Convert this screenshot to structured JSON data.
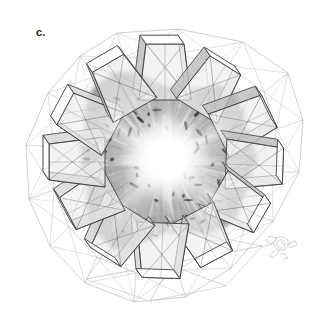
{
  "figure": {
    "panel_label": "c.",
    "background_color": "#ffffff",
    "width": 329,
    "height": 325
  },
  "render": {
    "style": "grayscale-3d-wireframe-with-volumetric-density",
    "outline_color": "#3c3c3c",
    "faint_wire_color": "#b9b9b9",
    "facet_fill_light": "#f2f2f2",
    "facet_fill_mid": "#d8d8d8",
    "facet_fill_dark": "#bdbdbd",
    "density_base_color": "#b0b0b0",
    "density_speck_color": "#6a6a6a",
    "core_highlight_color": "#ffffff"
  },
  "structure": {
    "name": "polyhedral-cage",
    "center": {
      "x": 165,
      "y": 162
    },
    "outer_hull_radius": 133,
    "description_visible_parts": [
      "outer faint polyhedral wireframe shell",
      "twelve radiating trapezoidal funnel protrusions",
      "central textured volumetric density mass",
      "bright white radiating core highlight"
    ],
    "hull_points": [
      {
        "x": 117,
        "y": 33
      },
      {
        "x": 178,
        "y": 29
      },
      {
        "x": 243,
        "y": 42
      },
      {
        "x": 288,
        "y": 73
      },
      {
        "x": 303,
        "y": 120
      },
      {
        "x": 299,
        "y": 172
      },
      {
        "x": 273,
        "y": 221
      },
      {
        "x": 231,
        "y": 268
      },
      {
        "x": 186,
        "y": 297
      },
      {
        "x": 134,
        "y": 302
      },
      {
        "x": 85,
        "y": 283
      },
      {
        "x": 50,
        "y": 246
      },
      {
        "x": 29,
        "y": 199
      },
      {
        "x": 26,
        "y": 145
      },
      {
        "x": 48,
        "y": 93
      },
      {
        "x": 80,
        "y": 56
      }
    ],
    "inner_hull_points": [
      {
        "x": 124,
        "y": 58
      },
      {
        "x": 175,
        "y": 54
      },
      {
        "x": 228,
        "y": 66
      },
      {
        "x": 264,
        "y": 92
      },
      {
        "x": 276,
        "y": 129
      },
      {
        "x": 272,
        "y": 172
      },
      {
        "x": 250,
        "y": 212
      },
      {
        "x": 215,
        "y": 248
      },
      {
        "x": 177,
        "y": 270
      },
      {
        "x": 136,
        "y": 273
      },
      {
        "x": 97,
        "y": 257
      },
      {
        "x": 69,
        "y": 227
      },
      {
        "x": 54,
        "y": 190
      },
      {
        "x": 53,
        "y": 147
      },
      {
        "x": 71,
        "y": 106
      },
      {
        "x": 96,
        "y": 76
      }
    ],
    "funnels": [
      {
        "id": "funnel-n",
        "angle_deg": -90,
        "base_radius": 62,
        "tip_radius": 118,
        "base_half_width": 26,
        "tip_half_width": 19
      },
      {
        "id": "funnel-nne",
        "angle_deg": -58,
        "base_radius": 60,
        "tip_radius": 114,
        "base_half_width": 24,
        "tip_half_width": 18
      },
      {
        "id": "funnel-ene",
        "angle_deg": -26,
        "base_radius": 60,
        "tip_radius": 116,
        "base_half_width": 24,
        "tip_half_width": 18
      },
      {
        "id": "funnel-e",
        "angle_deg": 2,
        "base_radius": 61,
        "tip_radius": 118,
        "base_half_width": 25,
        "tip_half_width": 18
      },
      {
        "id": "funnel-ese",
        "angle_deg": 30,
        "base_radius": 59,
        "tip_radius": 112,
        "base_half_width": 24,
        "tip_half_width": 17
      },
      {
        "id": "funnel-sse",
        "angle_deg": 62,
        "base_radius": 58,
        "tip_radius": 110,
        "base_half_width": 24,
        "tip_half_width": 18
      },
      {
        "id": "funnel-s",
        "angle_deg": 92,
        "base_radius": 61,
        "tip_radius": 116,
        "base_half_width": 26,
        "tip_half_width": 19
      },
      {
        "id": "funnel-ssw",
        "angle_deg": 122,
        "base_radius": 59,
        "tip_radius": 112,
        "base_half_width": 25,
        "tip_half_width": 18
      },
      {
        "id": "funnel-wsw",
        "angle_deg": 152,
        "base_radius": 58,
        "tip_radius": 110,
        "base_half_width": 24,
        "tip_half_width": 18
      },
      {
        "id": "funnel-w",
        "angle_deg": 180,
        "base_radius": 60,
        "tip_radius": 116,
        "base_half_width": 25,
        "tip_half_width": 18
      },
      {
        "id": "funnel-wnw",
        "angle_deg": -152,
        "base_radius": 59,
        "tip_radius": 113,
        "base_half_width": 24,
        "tip_half_width": 18
      },
      {
        "id": "funnel-nnw",
        "angle_deg": -120,
        "base_radius": 60,
        "tip_radius": 114,
        "base_half_width": 25,
        "tip_half_width": 18
      }
    ]
  },
  "density": {
    "name": "central-density-mass",
    "center": {
      "x": 163,
      "y": 160
    },
    "radius_x": 84,
    "radius_y": 80,
    "core_highlight": {
      "x": 166,
      "y": 158,
      "radius": 46
    },
    "speck_count": 52,
    "speck_seed": 7
  },
  "scale_object": {
    "name": "reference-molecule",
    "position": {
      "x": 277,
      "y": 246
    },
    "width": 40,
    "height": 28,
    "stroke_color": "#c8c8c8"
  }
}
